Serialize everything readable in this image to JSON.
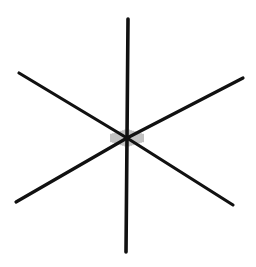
{
  "figure": {
    "background": "#ffffff",
    "stroke_color": "#111111",
    "hatch_color": "#555555",
    "center": [
      127,
      138
    ],
    "arms": [
      {
        "name": "top",
        "end": [
          128,
          19
        ],
        "width": 3.6
      },
      {
        "name": "bottom",
        "end": [
          126,
          252
        ],
        "width": 3.6
      },
      {
        "name": "upper-left",
        "end": [
          19,
          73
        ],
        "width": 3.2
      },
      {
        "name": "lower-right",
        "end": [
          233,
          205
        ],
        "width": 3.2
      },
      {
        "name": "upper-right",
        "end": [
          243,
          78
        ],
        "width": 3.2
      },
      {
        "name": "lower-left",
        "end": [
          16,
          202
        ],
        "width": 3.2
      }
    ]
  }
}
